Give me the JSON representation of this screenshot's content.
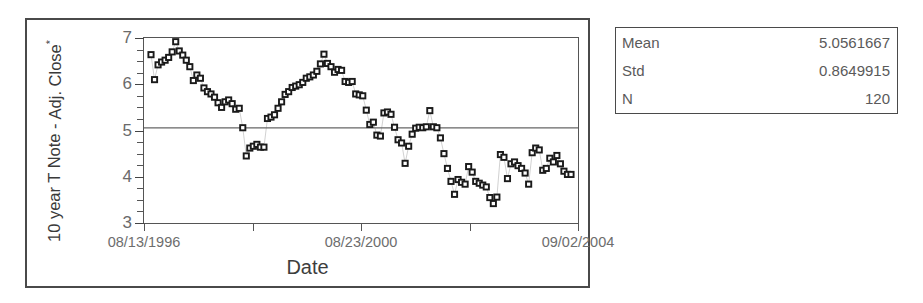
{
  "chart_data": {
    "type": "scatter",
    "title": "",
    "xlabel": "Date",
    "ylabel": "10 year T Note - Adj. Close*",
    "ylabel_line1": "10 year T Note -",
    "ylabel_line2": "Adj. Close",
    "ylabel_line2_sup": "*",
    "ylim": [
      3,
      7
    ],
    "yticks": [
      3,
      4,
      5,
      6,
      7
    ],
    "ytick_labels": [
      "3",
      "4",
      "5",
      "6",
      "7"
    ],
    "y_minor_ticks": [
      3.25,
      3.5,
      3.75,
      4.25,
      4.5,
      4.75,
      5.25,
      5.5,
      5.75,
      6.25,
      6.5,
      6.75
    ],
    "xtick_positions": [
      0.0,
      0.25,
      0.5,
      0.75,
      1.0
    ],
    "xtick_labels": [
      "08/13/1996",
      "",
      "08/23/2000",
      "",
      "09/02/2004"
    ],
    "xtick_labels_shown": [
      "08/13/1996",
      "08/23/2000",
      "09/02/2004"
    ],
    "grid": false,
    "legend": "none",
    "marker": "open-square",
    "connector": "light-dotted-line",
    "reference_line": {
      "name": "mean-line",
      "value": 5.0561667,
      "orientation": "horizontal",
      "color": "#666666"
    },
    "n_points": 120,
    "values": [
      6.64,
      6.1,
      6.42,
      6.48,
      6.52,
      6.58,
      6.7,
      6.92,
      6.72,
      6.63,
      6.52,
      6.38,
      6.08,
      6.2,
      6.13,
      5.92,
      5.84,
      5.79,
      5.72,
      5.6,
      5.5,
      5.62,
      5.66,
      5.58,
      5.46,
      5.48,
      5.06,
      4.45,
      4.62,
      4.66,
      4.7,
      4.64,
      4.64,
      5.26,
      5.29,
      5.34,
      5.48,
      5.62,
      5.78,
      5.84,
      5.93,
      5.96,
      5.99,
      6.04,
      6.13,
      6.16,
      6.2,
      6.28,
      6.44,
      6.65,
      6.45,
      6.38,
      6.26,
      6.32,
      6.3,
      6.06,
      6.04,
      6.06,
      5.79,
      5.77,
      5.75,
      5.44,
      5.13,
      5.18,
      4.9,
      4.88,
      5.38,
      5.4,
      5.35,
      5.07,
      4.8,
      4.73,
      4.29,
      4.66,
      4.92,
      5.05,
      5.07,
      5.06,
      5.08,
      5.43,
      5.08,
      5.06,
      4.84,
      4.5,
      4.18,
      3.9,
      3.62,
      3.94,
      3.88,
      3.84,
      4.22,
      4.1,
      3.9,
      3.86,
      3.82,
      3.78,
      3.55,
      3.42,
      3.56,
      4.48,
      4.42,
      3.96,
      4.28,
      4.32,
      4.24,
      4.18,
      4.08,
      3.84,
      4.52,
      4.62,
      4.58,
      4.14,
      4.18,
      4.4,
      4.32,
      4.46,
      4.28,
      4.12,
      4.05,
      4.05
    ]
  },
  "stats": {
    "rows": [
      {
        "label": "Mean",
        "value": "5.0561667"
      },
      {
        "label": "Std",
        "value": "0.8649915"
      },
      {
        "label": "N",
        "value": "120"
      }
    ]
  }
}
